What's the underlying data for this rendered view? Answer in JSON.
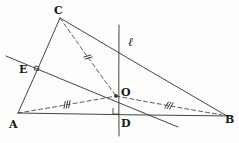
{
  "figure": {
    "kind": "geometry-diagram",
    "width": 239,
    "height": 143,
    "background_color": "#fdfdfc",
    "ink_color": "#3a3a3a",
    "label_color": "#1a1a1a"
  },
  "points": [
    {
      "id": "A",
      "label": "A",
      "x": 18,
      "y": 113,
      "label_x": 9,
      "label_y": 119
    },
    {
      "id": "B",
      "label": "B",
      "x": 222,
      "y": 115,
      "label_x": 225,
      "label_y": 114
    },
    {
      "id": "C",
      "label": "C",
      "x": 60,
      "y": 18,
      "label_x": 54,
      "label_y": 5
    },
    {
      "id": "D",
      "label": "D",
      "x": 119,
      "y": 114,
      "label_x": 121,
      "label_y": 118
    },
    {
      "id": "E",
      "label": "E",
      "x": 36,
      "y": 70,
      "label_x": 19,
      "label_y": 64
    },
    {
      "id": "O",
      "label": "O",
      "x": 116,
      "y": 96,
      "label_x": 121,
      "label_y": 87
    }
  ],
  "line_label": {
    "text": "ℓ",
    "x": 128,
    "y": 36
  },
  "segments": [
    {
      "name": "side-AC",
      "style": "solid",
      "from": [
        18,
        113
      ],
      "to": [
        60,
        18
      ],
      "ticks": 0
    },
    {
      "name": "side-AB",
      "style": "solid",
      "from": [
        18,
        113
      ],
      "to": [
        232,
        116
      ],
      "ticks": 0
    },
    {
      "name": "side-CB",
      "style": "solid",
      "from": [
        60,
        18
      ],
      "to": [
        227,
        116
      ],
      "ticks": 0
    },
    {
      "name": "perpendicular-bisector-of-AC",
      "style": "solid",
      "from": [
        6,
        56
      ],
      "to": [
        178,
        127
      ],
      "ticks": 0
    },
    {
      "name": "perpendicular-bisector-of-AB-line-l",
      "style": "solid",
      "from": [
        119,
        25
      ],
      "to": [
        119,
        136
      ],
      "ticks": 0
    },
    {
      "name": "radius-CO",
      "style": "dashed",
      "from": [
        60,
        18
      ],
      "to": [
        116,
        96
      ],
      "ticks": 2
    },
    {
      "name": "radius-AO",
      "style": "dashed",
      "from": [
        18,
        113
      ],
      "to": [
        116,
        96
      ],
      "ticks": 3
    },
    {
      "name": "radius-OB",
      "style": "dashed",
      "from": [
        116,
        96
      ],
      "to": [
        222,
        115
      ],
      "ticks": 3
    }
  ],
  "right_angle_marks": [
    {
      "name": "right-angle-at-E",
      "x": 36,
      "y": 70
    },
    {
      "name": "right-angle-at-D",
      "x": 119,
      "y": 114
    }
  ],
  "dot_markers": [
    {
      "name": "point-marker-O",
      "x": 116,
      "y": 96
    }
  ]
}
